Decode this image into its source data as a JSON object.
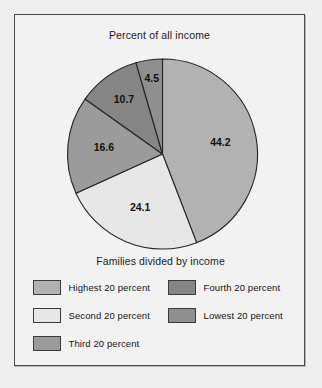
{
  "figure": {
    "title": "Percent of all income",
    "legend_title": "Families divided by income",
    "frame_color": "#4a4a4a",
    "background_color": "#efefef",
    "panel_color": "#f2f2f2"
  },
  "chart_data": {
    "type": "pie",
    "title": "Percent of all income",
    "legend_title": "Families divided by income",
    "legend_position": "bottom",
    "grid": false,
    "start_angle_deg": 0,
    "direction": "clockwise",
    "units": "percent",
    "categories": [
      "Highest 20 percent",
      "Second 20 percent",
      "Third 20 percent",
      "Fourth 20 percent",
      "Lowest 20 percent"
    ],
    "values": [
      44.2,
      24.1,
      16.6,
      10.7,
      4.5
    ],
    "colors": [
      "#b2b2b2",
      "#e7e7e7",
      "#9b9b9b",
      "#858585",
      "#8f8f8f"
    ],
    "slices": [
      {
        "label": "44.2",
        "value": 44.2,
        "category": "Highest 20 percent",
        "color": "#b2b2b2"
      },
      {
        "label": "24.1",
        "value": 24.1,
        "category": "Second 20 percent",
        "color": "#e7e7e7"
      },
      {
        "label": "16.6",
        "value": 16.6,
        "category": "Third 20 percent",
        "color": "#9b9b9b"
      },
      {
        "label": "10.7",
        "value": 10.7,
        "category": "Fourth 20 percent",
        "color": "#858585"
      },
      {
        "label": "4.5",
        "value": 4.5,
        "category": "Lowest 20 percent",
        "color": "#8f8f8f"
      }
    ]
  },
  "legend": {
    "items": [
      {
        "label": "Highest 20 percent",
        "color": "#b2b2b2",
        "column": "left",
        "row": 0
      },
      {
        "label": "Second 20 percent",
        "color": "#e7e7e7",
        "column": "left",
        "row": 1
      },
      {
        "label": "Third 20 percent",
        "color": "#9b9b9b",
        "column": "left",
        "row": 2
      },
      {
        "label": "Fourth 20 percent",
        "color": "#858585",
        "column": "right",
        "row": 0
      },
      {
        "label": "Lowest 20 percent",
        "color": "#8f8f8f",
        "column": "right",
        "row": 1
      }
    ]
  }
}
